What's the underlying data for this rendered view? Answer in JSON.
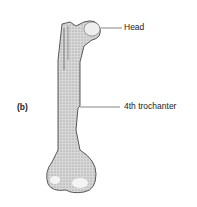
{
  "figure": {
    "panel_label": "(b)",
    "labels": {
      "head": "Head",
      "trochanter": "4th trochanter"
    }
  }
}
